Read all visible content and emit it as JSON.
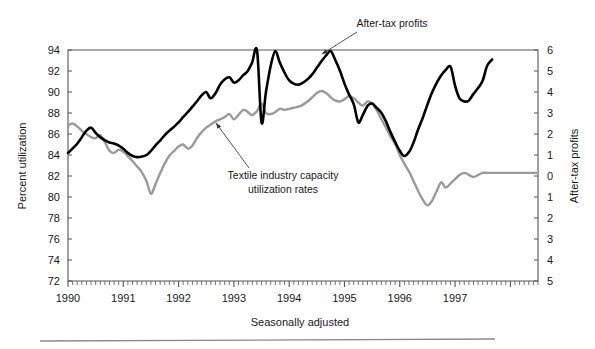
{
  "chart_data": {
    "type": "line",
    "title": "",
    "subtitle": "",
    "xlabel": "Seasonally adjusted",
    "ylabel": "Percent utilization",
    "y2label": "After-tax profits",
    "grid": false,
    "legend_position": "annotations-inline",
    "xlim": [
      1990.0,
      1998.5
    ],
    "x_tick_labels": [
      "1990",
      "1991",
      "1992",
      "1993",
      "1994",
      "1995",
      "1996",
      "1997"
    ],
    "x_tick_values": [
      1990,
      1991,
      1992,
      1993,
      1994,
      1995,
      1996,
      1997
    ],
    "x_minor_ticks": "monthly",
    "ylim": [
      72,
      94
    ],
    "y_tick_labels": [
      "94",
      "92",
      "90",
      "88",
      "86",
      "84",
      "82",
      "80",
      "78",
      "76",
      "74",
      "72"
    ],
    "y_tick_values": [
      94,
      92,
      90,
      88,
      86,
      84,
      82,
      80,
      78,
      76,
      74,
      72
    ],
    "y2lim": [
      -5,
      6
    ],
    "y2_tick_labels": [
      "6",
      "5",
      "4",
      "3",
      "2",
      "1",
      "0",
      "1",
      "2",
      "3",
      "4",
      "5"
    ],
    "y2_tick_values": [
      6,
      5,
      4,
      3,
      2,
      1,
      0,
      -1,
      -2,
      -3,
      -4,
      -5
    ],
    "annotations": [
      {
        "name": "after-tax-profits",
        "text": "After-tax profits",
        "text_x": 392,
        "text_y": 24,
        "arrow_from_x": 357,
        "arrow_from_y": 32,
        "arrow_to_x": 322,
        "arrow_to_y": 54
      },
      {
        "name": "textile-capacity",
        "text_line1": "Textile industry capacity",
        "text_line2": "utilization rates",
        "text_x": 279,
        "text_y1": 176,
        "text_y2": 190,
        "arrow_from_x": 249,
        "arrow_from_y": 168,
        "arrow_to_x": 216,
        "arrow_to_y": 123
      }
    ],
    "series": [
      {
        "name": "After-tax profits",
        "axis": "right",
        "color": "#000000",
        "width": 2.6,
        "x": [
          1990.0,
          1990.08,
          1990.17,
          1990.25,
          1990.33,
          1990.42,
          1990.5,
          1990.58,
          1990.67,
          1990.75,
          1990.83,
          1990.92,
          1991.0,
          1991.08,
          1991.17,
          1991.25,
          1991.33,
          1991.42,
          1991.5,
          1991.58,
          1991.67,
          1991.75,
          1991.83,
          1991.92,
          1992.0,
          1992.08,
          1992.17,
          1992.25,
          1992.33,
          1992.42,
          1992.5,
          1992.58,
          1992.67,
          1992.75,
          1992.83,
          1992.92,
          1993.0,
          1993.08,
          1993.17,
          1993.25,
          1993.33,
          1993.42,
          1993.5,
          1993.58,
          1993.67,
          1993.75,
          1993.83,
          1993.92,
          1994.0,
          1994.08,
          1994.17,
          1994.25,
          1994.33,
          1994.42,
          1994.5,
          1994.58,
          1994.67,
          1994.75,
          1994.83,
          1994.92,
          1995.0,
          1995.08,
          1995.17,
          1995.25,
          1995.33,
          1995.42,
          1995.5,
          1995.58,
          1995.67,
          1995.75,
          1995.83,
          1995.92,
          1996.0,
          1996.08,
          1996.17,
          1996.25,
          1996.33,
          1996.42,
          1996.5,
          1996.58,
          1996.67,
          1996.75,
          1996.83,
          1996.92,
          1997.0,
          1997.08,
          1997.17,
          1997.25,
          1997.33,
          1997.42,
          1997.5,
          1997.58,
          1997.67
        ],
        "values": [
          1.1,
          1.3,
          1.55,
          1.85,
          2.15,
          2.3,
          2.05,
          1.85,
          1.7,
          1.6,
          1.55,
          1.45,
          1.3,
          1.1,
          0.95,
          0.9,
          0.92,
          1.0,
          1.2,
          1.45,
          1.7,
          1.95,
          2.15,
          2.35,
          2.55,
          2.8,
          3.05,
          3.3,
          3.55,
          3.85,
          4.0,
          3.7,
          3.95,
          4.35,
          4.6,
          4.7,
          4.45,
          4.55,
          4.8,
          5.0,
          5.4,
          5.95,
          2.55,
          4.0,
          5.3,
          5.95,
          5.4,
          4.9,
          4.55,
          4.4,
          4.35,
          4.45,
          4.6,
          4.85,
          5.15,
          5.45,
          5.75,
          5.95,
          5.55,
          5.0,
          4.4,
          3.9,
          3.4,
          2.55,
          2.9,
          3.35,
          3.45,
          3.25,
          3.0,
          2.6,
          2.1,
          1.6,
          1.2,
          0.95,
          1.15,
          1.6,
          2.2,
          2.8,
          3.4,
          3.95,
          4.45,
          4.8,
          5.05,
          5.2,
          4.3,
          3.7,
          3.55,
          3.6,
          3.9,
          4.2,
          4.55,
          5.25,
          5.55
        ]
      },
      {
        "name": "Textile industry capacity utilization rates",
        "axis": "left",
        "color": "#9a9a9a",
        "width": 2.4,
        "x": [
          1990.0,
          1990.08,
          1990.17,
          1990.25,
          1990.33,
          1990.42,
          1990.5,
          1990.58,
          1990.67,
          1990.75,
          1990.83,
          1990.92,
          1991.0,
          1991.08,
          1991.17,
          1991.25,
          1991.33,
          1991.42,
          1991.5,
          1991.58,
          1991.67,
          1991.75,
          1991.83,
          1991.92,
          1992.0,
          1992.08,
          1992.17,
          1992.25,
          1992.33,
          1992.42,
          1992.5,
          1992.58,
          1992.67,
          1992.75,
          1992.83,
          1992.92,
          1993.0,
          1993.08,
          1993.17,
          1993.25,
          1993.33,
          1993.42,
          1993.5,
          1993.58,
          1993.67,
          1993.75,
          1993.83,
          1993.92,
          1994.0,
          1994.08,
          1994.17,
          1994.25,
          1994.33,
          1994.42,
          1994.5,
          1994.58,
          1994.67,
          1994.75,
          1994.83,
          1994.92,
          1995.0,
          1995.08,
          1995.17,
          1995.25,
          1995.33,
          1995.42,
          1995.5,
          1995.58,
          1995.67,
          1995.75,
          1995.83,
          1995.92,
          1996.0,
          1996.08,
          1996.17,
          1996.25,
          1996.33,
          1996.42,
          1996.5,
          1996.58,
          1996.67,
          1996.75,
          1996.83,
          1996.92,
          1997.0,
          1997.08,
          1997.17,
          1997.25,
          1997.33,
          1997.42,
          1997.5,
          1997.58,
          1997.67,
          1997.75,
          1997.83,
          1997.92,
          1998.0,
          1998.17,
          1998.33,
          1998.5
        ],
        "values": [
          86.8,
          87.0,
          86.7,
          86.3,
          86.0,
          85.7,
          85.6,
          85.9,
          85.2,
          84.4,
          84.2,
          84.5,
          84.3,
          83.9,
          83.4,
          82.9,
          82.4,
          81.5,
          80.3,
          81.2,
          82.3,
          83.2,
          83.9,
          84.4,
          84.8,
          85.0,
          84.6,
          84.9,
          85.6,
          86.2,
          86.6,
          86.9,
          87.2,
          87.4,
          87.6,
          87.9,
          87.4,
          87.8,
          88.3,
          88.1,
          87.8,
          88.2,
          88.9,
          88.0,
          87.9,
          88.1,
          88.4,
          88.3,
          88.4,
          88.5,
          88.6,
          88.8,
          89.1,
          89.5,
          89.9,
          90.1,
          89.9,
          89.5,
          89.2,
          89.1,
          89.3,
          89.6,
          89.4,
          89.0,
          88.7,
          89.1,
          88.9,
          88.3,
          87.4,
          86.6,
          85.8,
          85.0,
          84.0,
          83.2,
          82.4,
          81.5,
          80.6,
          79.7,
          79.2,
          79.6,
          80.6,
          81.4,
          80.9,
          81.3,
          81.7,
          82.1,
          82.3,
          82.1,
          81.9,
          82.1,
          82.3,
          82.3,
          82.3,
          82.3,
          82.3,
          82.3,
          82.3,
          82.3,
          82.3,
          82.3
        ]
      }
    ]
  },
  "axes": {
    "left_title": "Percent utilization",
    "right_title": "After-tax profits",
    "bottom_caption": "Seasonally adjusted"
  },
  "annotations": {
    "profits_label": "After-tax profits",
    "textile_label_line1": "Textile industry capacity",
    "textile_label_line2": "utilization rates"
  },
  "colors": {
    "profits_line": "#000000",
    "textile_line": "#9a9a9a",
    "axis": "#555555",
    "text": "#1a1a1a",
    "rule": "#777777",
    "background": "#ffffff"
  },
  "layout": {
    "plot_left": 68,
    "plot_right": 538,
    "plot_top": 50,
    "plot_bottom": 281
  }
}
